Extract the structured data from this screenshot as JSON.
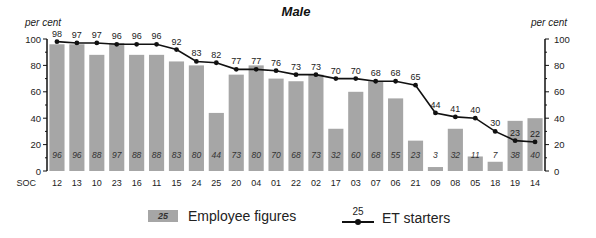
{
  "chart_data": {
    "type": "bar",
    "title": "Male",
    "ylabel_left": "per cent",
    "ylabel_right": "per cent",
    "xlabel": "SOC",
    "ylim": [
      0,
      100
    ],
    "yticks": [
      0,
      20,
      40,
      60,
      80,
      100
    ],
    "grid": false,
    "legend_position": "bottom",
    "categories": [
      "12",
      "13",
      "10",
      "23",
      "16",
      "11",
      "15",
      "24",
      "25",
      "20",
      "04",
      "01",
      "22",
      "02",
      "17",
      "03",
      "07",
      "06",
      "21",
      "09",
      "08",
      "05",
      "18",
      "19",
      "14"
    ],
    "series": [
      {
        "name": "Employee figures",
        "type": "bar",
        "color": "#a6a6a6",
        "values": [
          96,
          96,
          88,
          97,
          88,
          88,
          83,
          80,
          44,
          73,
          80,
          70,
          68,
          73,
          32,
          60,
          68,
          55,
          23,
          3,
          32,
          11,
          7,
          38,
          40
        ]
      },
      {
        "name": "ET starters",
        "type": "line",
        "color": "#111111",
        "values": [
          98,
          97,
          97,
          96,
          96,
          96,
          92,
          83,
          82,
          77,
          77,
          76,
          73,
          73,
          70,
          70,
          68,
          68,
          65,
          44,
          41,
          40,
          30,
          23,
          22
        ]
      }
    ]
  },
  "legend": {
    "bar_label": "Employee figures",
    "bar_sample": "25",
    "line_label": "ET starters",
    "line_sample": "25"
  }
}
